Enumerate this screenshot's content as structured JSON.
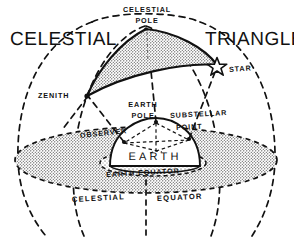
{
  "figure": {
    "title_left": "CELESTIAL",
    "title_right": "TRIANGLE",
    "background_color": "#ffffff",
    "ink_color": "#111111",
    "stipple_color": "#2b2b2b"
  },
  "labels": {
    "celestial_pole_line1": "CELESTIAL",
    "celestial_pole_line2": "POLE",
    "star": "STAR",
    "zenith": "ZENITH",
    "earth_pole_line1": "EARTH",
    "earth_pole_line2": "POLE",
    "substellar_line1": "SUBSTELLAR",
    "substellar_line2": "POINT",
    "observer": "OBSERVER",
    "earth": "EARTH",
    "earth_equator": "EARTH EQUATOR",
    "celestial_equator_left": "CELESTIAL",
    "celestial_equator_right": "EQUATOR"
  },
  "markers": {
    "celestial_pole_vertex": "celestial-pole-vertex",
    "zenith_vertex": "zenith-vertex",
    "star_vertex": "star-glyph",
    "earth_pole_point": "earth-pole-point",
    "observer_point": "observer-point",
    "substellar_point": "substellar-point"
  },
  "shapes": {
    "celestial_triangle": "shaded spherical triangle between celestial pole, zenith and star",
    "celestial_equator_plane": "large stippled ellipse",
    "earth_hemisphere": "dome shaped Earth",
    "celestial_sphere": "dashed outer sphere arcs"
  }
}
